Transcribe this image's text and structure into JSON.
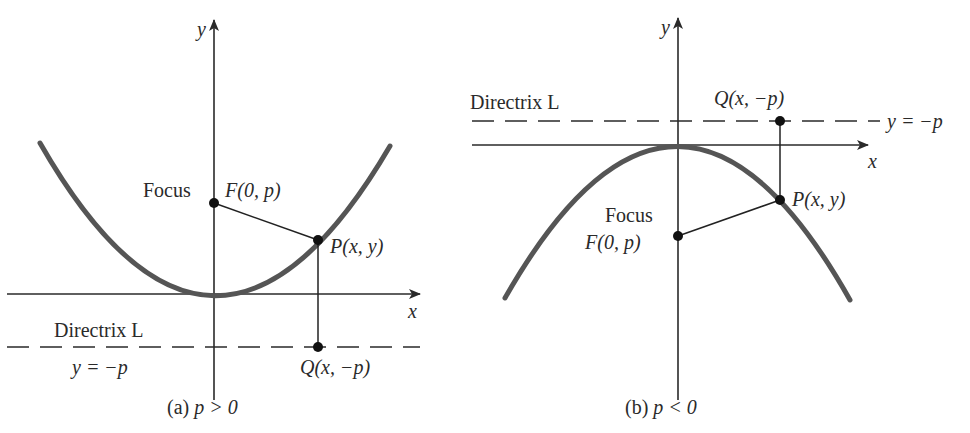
{
  "figure": {
    "panel_a": {
      "caption_prefix": "(a) ",
      "caption_condition": "p > 0",
      "axis_x_label": "x",
      "axis_y_label": "y",
      "focus_word": "Focus",
      "focus_label": "F(0, p)",
      "point_label": "P(x, y)",
      "directrix_label": "Directrix L",
      "directrix_equation": "y = −p",
      "projection_label": "Q(x, −p)",
      "opening": "up"
    },
    "panel_b": {
      "caption_prefix": "(b) ",
      "caption_condition": "p < 0",
      "axis_x_label": "x",
      "axis_y_label": "y",
      "focus_word": "Focus",
      "focus_label": "F(0, p)",
      "point_label": "P(x, y)",
      "directrix_label": "Directrix L",
      "directrix_equation": "y = −p",
      "projection_label": "Q(x, −p)",
      "opening": "down"
    }
  },
  "colors": {
    "curve": "#555555",
    "lines": "#2a2a2a",
    "points": "#111111",
    "background": "#ffffff"
  }
}
